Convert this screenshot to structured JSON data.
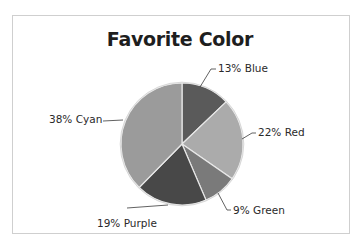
{
  "chart_data": {
    "type": "pie",
    "title": "Favorite Color",
    "categories": [
      "Blue",
      "Red",
      "Green",
      "Purple",
      "Cyan"
    ],
    "values": [
      13,
      22,
      9,
      19,
      38
    ],
    "unit": "%",
    "labels": [
      "13% Blue",
      "22% Red",
      "9% Green",
      "19% Purple",
      "38% Cyan"
    ],
    "colors": [
      "#5a5a5a",
      "#ababab",
      "#7a7a7a",
      "#484848",
      "#9b9b9b"
    ],
    "start_angle_deg": 0,
    "direction": "clockwise",
    "legend": "none (data labels with leader lines)"
  },
  "chart": {
    "title": "Favorite Color"
  }
}
